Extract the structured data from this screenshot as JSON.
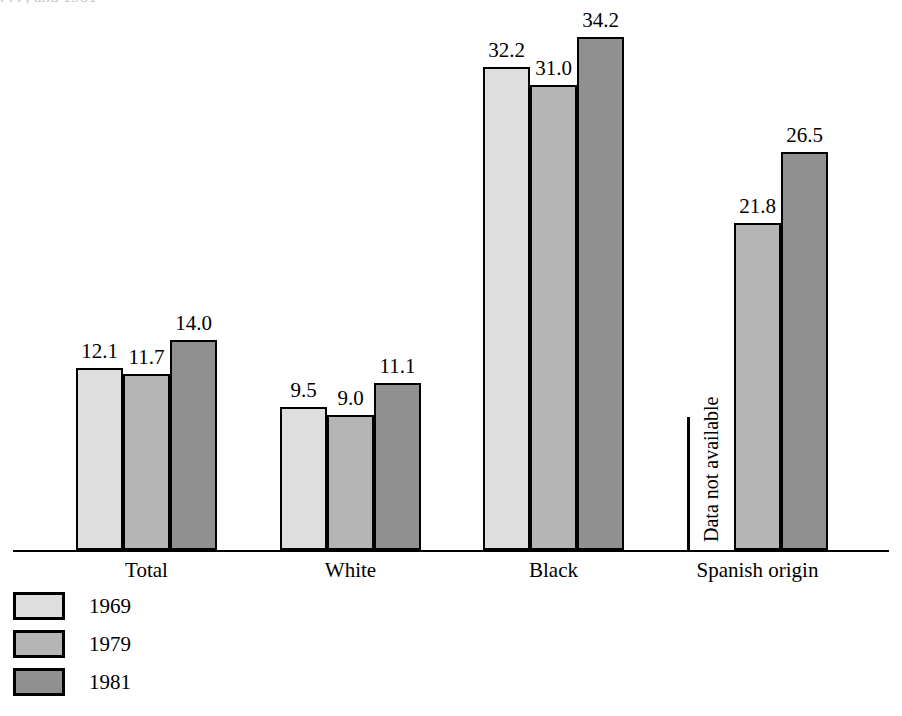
{
  "title_remnant": ". . . , and 1981",
  "chart_data": {
    "type": "bar",
    "title": "",
    "subtitle": "",
    "xlabel": "",
    "ylabel": "",
    "ylim": [
      0,
      36
    ],
    "grid": false,
    "legend_position": "bottom-left",
    "categories": [
      "Total",
      "White",
      "Black",
      "Spanish origin"
    ],
    "series": [
      {
        "name": "1969",
        "color": "#dedede",
        "values": [
          12.1,
          9.5,
          32.2,
          null
        ],
        "labels": [
          "12.1",
          "9.5",
          "32.2",
          ""
        ]
      },
      {
        "name": "1979",
        "color": "#b5b5b5",
        "values": [
          11.7,
          9.0,
          31.0,
          21.8
        ],
        "labels": [
          "11.7",
          "9.0",
          "31.0",
          "21.8"
        ]
      },
      {
        "name": "1981",
        "color": "#909090",
        "values": [
          14.0,
          11.1,
          34.2,
          26.5
        ],
        "labels": [
          "14.0",
          "11.1",
          "34.2",
          "26.5"
        ]
      }
    ],
    "annotations": [
      {
        "text": "Data not available",
        "category": "Spanish origin",
        "series": "1969",
        "rotation": -90
      }
    ]
  },
  "legend": {
    "items": [
      {
        "label": "1969",
        "color": "#dedede"
      },
      {
        "label": "1979",
        "color": "#b5b5b5"
      },
      {
        "label": "1981",
        "color": "#909090"
      }
    ]
  },
  "axis": {
    "baseline_color": "#000000"
  }
}
